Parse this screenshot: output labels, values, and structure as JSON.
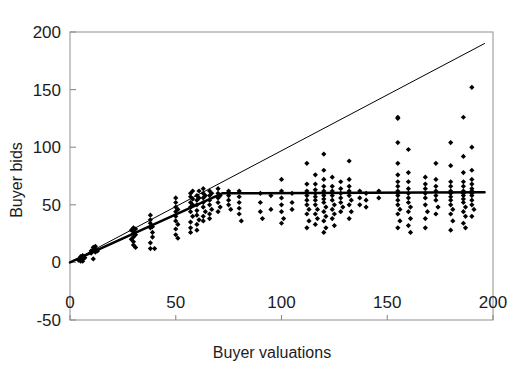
{
  "chart_data": {
    "type": "scatter",
    "title": "",
    "xlabel": "Buyer valuations",
    "ylabel": "Buyer bids",
    "xlim": [
      0,
      200
    ],
    "ylim": [
      -50,
      200
    ],
    "xticks": [
      0,
      50,
      100,
      150,
      200
    ],
    "yticks": [
      -50,
      0,
      50,
      100,
      150,
      200
    ],
    "xtick_labels": [
      "0",
      "50",
      "100",
      "150",
      "200"
    ],
    "ytick_labels": [
      "-50",
      "0",
      "50",
      "100",
      "150",
      "200"
    ],
    "grid": false,
    "legend": "none",
    "marker": "filled-diamond",
    "marker_color": "#000000",
    "series": [
      {
        "name": "Observed bids",
        "type": "scatter",
        "points": [
          [
            4,
            2
          ],
          [
            5,
            3
          ],
          [
            5,
            5
          ],
          [
            6,
            3
          ],
          [
            6,
            6
          ],
          [
            7,
            4
          ],
          [
            5,
            1
          ],
          [
            6,
            1
          ],
          [
            10,
            8
          ],
          [
            10,
            10
          ],
          [
            11,
            11
          ],
          [
            11,
            13
          ],
          [
            12,
            9
          ],
          [
            12,
            12
          ],
          [
            12,
            14
          ],
          [
            11,
            3
          ],
          [
            13,
            10
          ],
          [
            29,
            28
          ],
          [
            30,
            22
          ],
          [
            30,
            25
          ],
          [
            30,
            27
          ],
          [
            30,
            30
          ],
          [
            31,
            24
          ],
          [
            31,
            29
          ],
          [
            30,
            18
          ],
          [
            30,
            15
          ],
          [
            31,
            13
          ],
          [
            29,
            20
          ],
          [
            38,
            30
          ],
          [
            38,
            34
          ],
          [
            38,
            37
          ],
          [
            39,
            26
          ],
          [
            39,
            31
          ],
          [
            38,
            41
          ],
          [
            39,
            22
          ],
          [
            38,
            12
          ],
          [
            40,
            12
          ],
          [
            38,
            17
          ],
          [
            50,
            48
          ],
          [
            50,
            44
          ],
          [
            50,
            40
          ],
          [
            50,
            36
          ],
          [
            50,
            52
          ],
          [
            51,
            33
          ],
          [
            50,
            29
          ],
          [
            51,
            46
          ],
          [
            50,
            24
          ],
          [
            51,
            21
          ],
          [
            50,
            56
          ],
          [
            57,
            57
          ],
          [
            57,
            52
          ],
          [
            57,
            48
          ],
          [
            57,
            44
          ],
          [
            57,
            60
          ],
          [
            58,
            40
          ],
          [
            57,
            35
          ],
          [
            58,
            55
          ],
          [
            57,
            30
          ],
          [
            58,
            62
          ],
          [
            57,
            26
          ],
          [
            58,
            50
          ],
          [
            60,
            58
          ],
          [
            60,
            54
          ],
          [
            60,
            50
          ],
          [
            60,
            45
          ],
          [
            61,
            62
          ],
          [
            60,
            41
          ],
          [
            61,
            37
          ],
          [
            60,
            33
          ],
          [
            61,
            56
          ],
          [
            60,
            28
          ],
          [
            63,
            60
          ],
          [
            63,
            56
          ],
          [
            63,
            52
          ],
          [
            63,
            48
          ],
          [
            63,
            64
          ],
          [
            64,
            44
          ],
          [
            63,
            40
          ],
          [
            64,
            58
          ],
          [
            63,
            36
          ],
          [
            66,
            62
          ],
          [
            66,
            58
          ],
          [
            66,
            54
          ],
          [
            66,
            50
          ],
          [
            67,
            46
          ],
          [
            66,
            42
          ],
          [
            67,
            60
          ],
          [
            66,
            38
          ],
          [
            70,
            60
          ],
          [
            70,
            56
          ],
          [
            70,
            52
          ],
          [
            70,
            64
          ],
          [
            71,
            48
          ],
          [
            70,
            44
          ],
          [
            71,
            58
          ],
          [
            75,
            62
          ],
          [
            75,
            58
          ],
          [
            75,
            54
          ],
          [
            75,
            50
          ],
          [
            76,
            46
          ],
          [
            80,
            62
          ],
          [
            80,
            57
          ],
          [
            80,
            52
          ],
          [
            80,
            47
          ],
          [
            80,
            42
          ],
          [
            81,
            36
          ],
          [
            90,
            60
          ],
          [
            90,
            52
          ],
          [
            90,
            44
          ],
          [
            91,
            38
          ],
          [
            95,
            58
          ],
          [
            95,
            46
          ],
          [
            100,
            72
          ],
          [
            100,
            62
          ],
          [
            100,
            56
          ],
          [
            100,
            50
          ],
          [
            100,
            44
          ],
          [
            101,
            38
          ],
          [
            100,
            34
          ],
          [
            105,
            60
          ],
          [
            105,
            52
          ],
          [
            105,
            46
          ],
          [
            112,
            86
          ],
          [
            112,
            68
          ],
          [
            112,
            62
          ],
          [
            112,
            58
          ],
          [
            112,
            54
          ],
          [
            112,
            50
          ],
          [
            113,
            46
          ],
          [
            112,
            42
          ],
          [
            113,
            36
          ],
          [
            112,
            30
          ],
          [
            116,
            76
          ],
          [
            116,
            68
          ],
          [
            116,
            63
          ],
          [
            116,
            60
          ],
          [
            116,
            57
          ],
          [
            116,
            54
          ],
          [
            116,
            50
          ],
          [
            117,
            46
          ],
          [
            116,
            42
          ],
          [
            117,
            38
          ],
          [
            116,
            33
          ],
          [
            120,
            94
          ],
          [
            120,
            80
          ],
          [
            120,
            72
          ],
          [
            120,
            66
          ],
          [
            120,
            62
          ],
          [
            120,
            60
          ],
          [
            120,
            58
          ],
          [
            120,
            55
          ],
          [
            120,
            52
          ],
          [
            121,
            48
          ],
          [
            120,
            44
          ],
          [
            121,
            40
          ],
          [
            120,
            36
          ],
          [
            121,
            30
          ],
          [
            120,
            26
          ],
          [
            124,
            74
          ],
          [
            124,
            66
          ],
          [
            124,
            62
          ],
          [
            124,
            58
          ],
          [
            124,
            54
          ],
          [
            125,
            50
          ],
          [
            124,
            46
          ],
          [
            125,
            42
          ],
          [
            124,
            38
          ],
          [
            125,
            32
          ],
          [
            128,
            70
          ],
          [
            128,
            64
          ],
          [
            128,
            60
          ],
          [
            128,
            56
          ],
          [
            128,
            52
          ],
          [
            129,
            48
          ],
          [
            128,
            44
          ],
          [
            132,
            88
          ],
          [
            132,
            72
          ],
          [
            132,
            66
          ],
          [
            132,
            62
          ],
          [
            132,
            58
          ],
          [
            133,
            54
          ],
          [
            132,
            50
          ],
          [
            133,
            44
          ],
          [
            132,
            38
          ],
          [
            137,
            62
          ],
          [
            137,
            56
          ],
          [
            137,
            50
          ],
          [
            140,
            60
          ],
          [
            140,
            54
          ],
          [
            140,
            48
          ],
          [
            146,
            62
          ],
          [
            146,
            56
          ],
          [
            155,
            125
          ],
          [
            155,
            126
          ],
          [
            155,
            104
          ],
          [
            155,
            86
          ],
          [
            155,
            76
          ],
          [
            155,
            70
          ],
          [
            155,
            66
          ],
          [
            155,
            62
          ],
          [
            155,
            60
          ],
          [
            155,
            58
          ],
          [
            155,
            54
          ],
          [
            155,
            50
          ],
          [
            156,
            46
          ],
          [
            155,
            42
          ],
          [
            156,
            36
          ],
          [
            155,
            30
          ],
          [
            160,
            98
          ],
          [
            160,
            78
          ],
          [
            160,
            70
          ],
          [
            160,
            64
          ],
          [
            160,
            60
          ],
          [
            160,
            56
          ],
          [
            160,
            52
          ],
          [
            161,
            48
          ],
          [
            160,
            44
          ],
          [
            161,
            38
          ],
          [
            160,
            32
          ],
          [
            161,
            26
          ],
          [
            168,
            74
          ],
          [
            168,
            68
          ],
          [
            168,
            64
          ],
          [
            168,
            60
          ],
          [
            168,
            56
          ],
          [
            168,
            50
          ],
          [
            169,
            44
          ],
          [
            168,
            38
          ],
          [
            168,
            30
          ],
          [
            173,
            86
          ],
          [
            173,
            72
          ],
          [
            173,
            66
          ],
          [
            173,
            62
          ],
          [
            173,
            58
          ],
          [
            173,
            54
          ],
          [
            174,
            48
          ],
          [
            173,
            42
          ],
          [
            180,
            104
          ],
          [
            180,
            84
          ],
          [
            180,
            70
          ],
          [
            180,
            66
          ],
          [
            180,
            62
          ],
          [
            180,
            60
          ],
          [
            180,
            57
          ],
          [
            180,
            54
          ],
          [
            180,
            50
          ],
          [
            181,
            46
          ],
          [
            180,
            42
          ],
          [
            181,
            36
          ],
          [
            180,
            28
          ],
          [
            186,
            126
          ],
          [
            186,
            92
          ],
          [
            186,
            78
          ],
          [
            186,
            70
          ],
          [
            186,
            66
          ],
          [
            186,
            62
          ],
          [
            186,
            60
          ],
          [
            186,
            58
          ],
          [
            186,
            55
          ],
          [
            186,
            52
          ],
          [
            187,
            48
          ],
          [
            186,
            44
          ],
          [
            187,
            40
          ],
          [
            186,
            34
          ],
          [
            187,
            30
          ],
          [
            190,
            152
          ],
          [
            190,
            100
          ],
          [
            190,
            80
          ],
          [
            190,
            72
          ],
          [
            190,
            68
          ],
          [
            190,
            64
          ],
          [
            190,
            62
          ],
          [
            190,
            60
          ],
          [
            190,
            58
          ],
          [
            190,
            54
          ],
          [
            190,
            50
          ],
          [
            191,
            46
          ],
          [
            190,
            40
          ]
        ]
      }
    ],
    "reference_lines": [
      {
        "name": "45-degree line",
        "style": "thin",
        "width": 1,
        "color": "#000000",
        "points": [
          [
            0,
            0
          ],
          [
            196,
            190
          ]
        ]
      },
      {
        "name": "equilibrium bid function",
        "style": "thick",
        "width": 2.5,
        "color": "#000000",
        "points": [
          [
            0,
            0
          ],
          [
            72,
            60
          ],
          [
            196,
            61
          ]
        ]
      }
    ]
  },
  "axes": {
    "x_axis_name": "buyer-valuations-axis",
    "y_axis_name": "buyer-bids-axis"
  }
}
